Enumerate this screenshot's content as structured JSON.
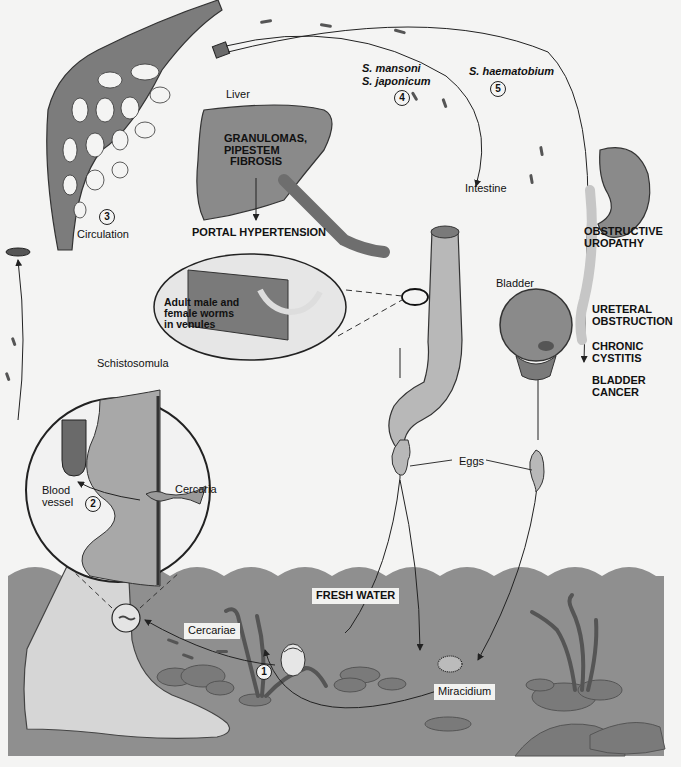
{
  "diagram": {
    "colors": {
      "background": "#f4f4f3",
      "water": "#8f8f8f",
      "organ_fill": "#8a8a8a",
      "organ_light": "#b8b8b8",
      "vessel_dark": "#6e6e6e",
      "skin": "#d4d4d4",
      "line": "#222222"
    },
    "steps": [
      {
        "number": "1",
        "label": "Snail host"
      },
      {
        "number": "2",
        "label": "Skin penetration"
      },
      {
        "number": "3",
        "label": "Circulation"
      },
      {
        "number": "4",
        "label": "S. mansoni / S. japonicum route"
      },
      {
        "number": "5",
        "label": "S. haematobium route"
      }
    ],
    "labels": {
      "liver": "Liver",
      "liver_pathology": "GRANULOMAS,\nPIPESTEM\n  FIBROSIS",
      "portal_hypertension": "PORTAL HYPERTENSION",
      "circulation": "Circulation",
      "species_mansoni": "S. mansoni",
      "species_japonicum": "S. japonicum",
      "species_haematobium": "S. haematobium",
      "intestine": "Intestine",
      "obstructive_uropathy": "OBSTRUCTIVE\nUROPATHY",
      "bladder": "Bladder",
      "ureteral_obstruction": "URETERAL\nOBSTRUCTION",
      "chronic_cystitis": "CHRONIC\nCYSTITIS",
      "bladder_cancer": "BLADDER\nCANCER",
      "adult_worms": "Adult male and\nfemale worms\nin venules",
      "schistosomula": "Schistosomula",
      "blood_vessel": "Blood\nvessel",
      "cercaria": "Cercaria",
      "eggs": "Eggs",
      "fresh_water": "FRESH WATER",
      "cercariae": "Cercariae",
      "miracidium": "Miracidium"
    }
  }
}
